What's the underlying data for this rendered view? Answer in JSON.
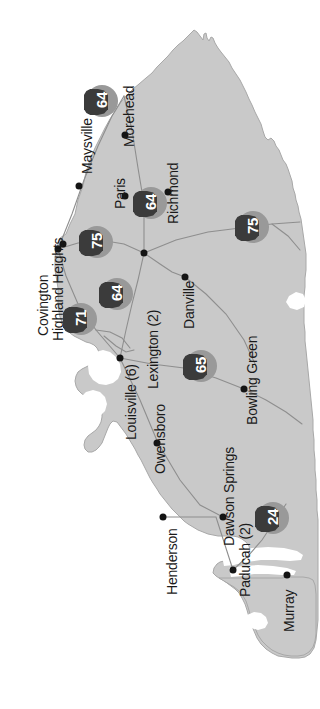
{
  "map": {
    "title": "Kentucky state map",
    "orientation_note": "rotated 90 degrees clockwise",
    "colors": {
      "state_fill": "#c9c9c9",
      "state_outline": "#a0a0a0",
      "background": "#ffffff",
      "road_line": "#8c8c8c",
      "water": "#ffffff",
      "city_dot": "#141414",
      "label_text": "#1a1a1a",
      "shield_halo": "#999999",
      "shield_plate": "#3b3b3b",
      "shield_number": "#ffffff"
    },
    "cities": [
      {
        "name": "Covington",
        "label_x": 36,
        "label_y": 336,
        "dot_x": 58,
        "dot_y": 249
      },
      {
        "name": "Highland Heights",
        "label_x": 51,
        "label_y": 341,
        "dot_x": 63,
        "dot_y": 244
      },
      {
        "name": "Maysville",
        "label_x": 80,
        "label_y": 174,
        "dot_x": 79,
        "dot_y": 186
      },
      {
        "name": "Morehead",
        "label_x": 122,
        "label_y": 147,
        "dot_x": 125,
        "dot_y": 135
      },
      {
        "name": "Paris",
        "label_x": 113,
        "label_y": 209,
        "dot_x": 125,
        "dot_y": 196
      },
      {
        "name": "Richmond",
        "label_x": 166,
        "label_y": 224,
        "dot_x": 168,
        "dot_y": 192
      },
      {
        "name": "Lexington (2)",
        "label_x": 146,
        "label_y": 389,
        "dot_x": 144,
        "dot_y": 253
      },
      {
        "name": "Danville",
        "label_x": 182,
        "label_y": 329,
        "dot_x": 185,
        "dot_y": 277
      },
      {
        "name": "Louisville (6)",
        "label_x": 124,
        "label_y": 440,
        "dot_x": 120,
        "dot_y": 358
      },
      {
        "name": "Owensboro",
        "label_x": 153,
        "label_y": 474,
        "dot_x": 157,
        "dot_y": 443
      },
      {
        "name": "Bowling Green",
        "label_x": 245,
        "label_y": 425,
        "dot_x": 244,
        "dot_y": 389
      },
      {
        "name": "Henderson",
        "label_x": 165,
        "label_y": 595,
        "dot_x": 163,
        "dot_y": 517
      },
      {
        "name": "Dawson Springs",
        "label_x": 222,
        "label_y": 546,
        "dot_x": 223,
        "dot_y": 517
      },
      {
        "name": "Paducah (2)",
        "label_x": 238,
        "label_y": 597,
        "dot_x": 233,
        "dot_y": 570
      },
      {
        "name": "Murray",
        "label_x": 282,
        "label_y": 632,
        "dot_x": 287,
        "dot_y": 575
      }
    ],
    "highways": [
      {
        "number": "64",
        "x": 101,
        "y": 102
      },
      {
        "number": "64",
        "x": 150,
        "y": 204
      },
      {
        "number": "75",
        "x": 252,
        "y": 228
      },
      {
        "number": "75",
        "x": 96,
        "y": 243
      },
      {
        "number": "64",
        "x": 116,
        "y": 295
      },
      {
        "number": "71",
        "x": 80,
        "y": 320
      },
      {
        "number": "65",
        "x": 200,
        "y": 367
      },
      {
        "number": "24",
        "x": 272,
        "y": 519
      }
    ]
  }
}
